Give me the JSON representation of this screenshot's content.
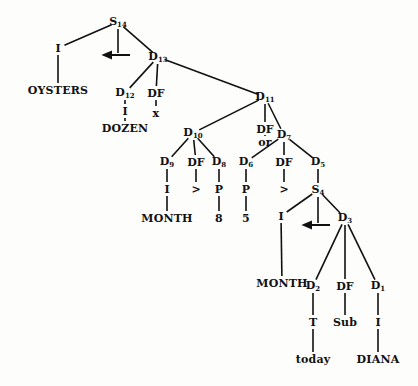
{
  "diagram": {
    "type": "tree",
    "nodes": [
      {
        "id": "S14",
        "label": "S",
        "sub": "14",
        "x": 118,
        "y": 22
      },
      {
        "id": "I_a",
        "label": "I",
        "x": 58,
        "y": 48
      },
      {
        "id": "arrow_a",
        "label": "←",
        "x": 118,
        "y": 55,
        "kind": "arrow"
      },
      {
        "id": "D13",
        "label": "D",
        "sub": "13",
        "x": 158,
        "y": 57
      },
      {
        "id": "OYSTERS",
        "label": "OYSTERS",
        "x": 58,
        "y": 90,
        "leaf": true
      },
      {
        "id": "D12",
        "label": "D",
        "sub": "12",
        "x": 125,
        "y": 93
      },
      {
        "id": "DF_a",
        "label": "DF",
        "x": 156,
        "y": 93
      },
      {
        "id": "D11",
        "label": "D",
        "sub": "11",
        "x": 265,
        "y": 97
      },
      {
        "id": "I_b",
        "label": "I",
        "x": 125,
        "y": 111
      },
      {
        "id": "x",
        "label": "x",
        "x": 156,
        "y": 113,
        "leaf": true
      },
      {
        "id": "DOZEN",
        "label": "DOZEN",
        "x": 125,
        "y": 128,
        "leaf": true
      },
      {
        "id": "D10",
        "label": "D",
        "sub": "10",
        "x": 193,
        "y": 133
      },
      {
        "id": "DF_b",
        "label": "DF",
        "x": 265,
        "y": 129
      },
      {
        "id": "D7",
        "label": "D",
        "sub": "7",
        "x": 284,
        "y": 135
      },
      {
        "id": "or",
        "label": "or",
        "x": 265,
        "y": 142,
        "leaf": true
      },
      {
        "id": "D9",
        "label": "D",
        "sub": "9",
        "x": 167,
        "y": 162
      },
      {
        "id": "DF_c",
        "label": "DF",
        "x": 196,
        "y": 162
      },
      {
        "id": "D8",
        "label": "D",
        "sub": "8",
        "x": 219,
        "y": 162
      },
      {
        "id": "D6",
        "label": "D",
        "sub": "6",
        "x": 246,
        "y": 162
      },
      {
        "id": "DF_d",
        "label": "DF",
        "x": 284,
        "y": 162
      },
      {
        "id": "D5",
        "label": "D",
        "sub": "5",
        "x": 318,
        "y": 162
      },
      {
        "id": "I_c",
        "label": "I",
        "x": 167,
        "y": 189
      },
      {
        "id": "gt_a",
        "label": ">",
        "x": 196,
        "y": 189
      },
      {
        "id": "P_a",
        "label": "P",
        "x": 219,
        "y": 189
      },
      {
        "id": "P_b",
        "label": "P",
        "x": 246,
        "y": 189
      },
      {
        "id": "gt_b",
        "label": ">",
        "x": 284,
        "y": 189
      },
      {
        "id": "S4",
        "label": "S",
        "sub": "4",
        "x": 318,
        "y": 190
      },
      {
        "id": "MONTH_a",
        "label": "MONTH",
        "x": 167,
        "y": 218,
        "leaf": true
      },
      {
        "id": "eight",
        "label": "8",
        "x": 219,
        "y": 218,
        "leaf": true
      },
      {
        "id": "five",
        "label": "5",
        "x": 246,
        "y": 218,
        "leaf": true
      },
      {
        "id": "I_d",
        "label": "I",
        "x": 281,
        "y": 216
      },
      {
        "id": "arrow_b",
        "label": "←",
        "x": 318,
        "y": 225,
        "kind": "arrow"
      },
      {
        "id": "D3",
        "label": "D",
        "sub": "3",
        "x": 345,
        "y": 218
      },
      {
        "id": "MONTH_b",
        "label": "MONTH",
        "x": 282,
        "y": 283,
        "leaf": true
      },
      {
        "id": "D2",
        "label": "D",
        "sub": "2",
        "x": 313,
        "y": 286
      },
      {
        "id": "DF_e",
        "label": "DF",
        "x": 345,
        "y": 286
      },
      {
        "id": "D1",
        "label": "D",
        "sub": "1",
        "x": 378,
        "y": 286
      },
      {
        "id": "T",
        "label": "T",
        "x": 313,
        "y": 322
      },
      {
        "id": "Sub",
        "label": "Sub",
        "x": 345,
        "y": 322,
        "leaf": true
      },
      {
        "id": "I_e",
        "label": "I",
        "x": 378,
        "y": 322
      },
      {
        "id": "today",
        "label": "today",
        "x": 313,
        "y": 359,
        "leaf": true
      },
      {
        "id": "DIANA",
        "label": "DIANA",
        "x": 378,
        "y": 359,
        "leaf": true
      }
    ],
    "edges": [
      [
        "S14",
        "I_a"
      ],
      [
        "S14",
        "arrow_a"
      ],
      [
        "S14",
        "D13"
      ],
      [
        "I_a",
        "OYSTERS"
      ],
      [
        "D13",
        "D12"
      ],
      [
        "D13",
        "DF_a"
      ],
      [
        "D13",
        "D11"
      ],
      [
        "D12",
        "I_b"
      ],
      [
        "I_b",
        "DOZEN"
      ],
      [
        "DF_a",
        "x"
      ],
      [
        "D11",
        "D10"
      ],
      [
        "D11",
        "DF_b"
      ],
      [
        "D11",
        "D7"
      ],
      [
        "DF_b",
        "or"
      ],
      [
        "D10",
        "D9"
      ],
      [
        "D10",
        "DF_c"
      ],
      [
        "D10",
        "D8"
      ],
      [
        "D9",
        "I_c"
      ],
      [
        "I_c",
        "MONTH_a"
      ],
      [
        "DF_c",
        "gt_a"
      ],
      [
        "D8",
        "P_a"
      ],
      [
        "P_a",
        "eight"
      ],
      [
        "D7",
        "D6"
      ],
      [
        "D7",
        "DF_d"
      ],
      [
        "D7",
        "D5"
      ],
      [
        "D6",
        "P_b"
      ],
      [
        "P_b",
        "five"
      ],
      [
        "DF_d",
        "gt_b"
      ],
      [
        "D5",
        "S4"
      ],
      [
        "S4",
        "I_d"
      ],
      [
        "S4",
        "arrow_b"
      ],
      [
        "S4",
        "D3"
      ],
      [
        "I_d",
        "MONTH_b"
      ],
      [
        "D3",
        "D2"
      ],
      [
        "D3",
        "DF_e"
      ],
      [
        "D3",
        "D1"
      ],
      [
        "D2",
        "T"
      ],
      [
        "T",
        "today"
      ],
      [
        "DF_e",
        "Sub"
      ],
      [
        "D1",
        "I_e"
      ],
      [
        "I_e",
        "DIANA"
      ]
    ]
  }
}
